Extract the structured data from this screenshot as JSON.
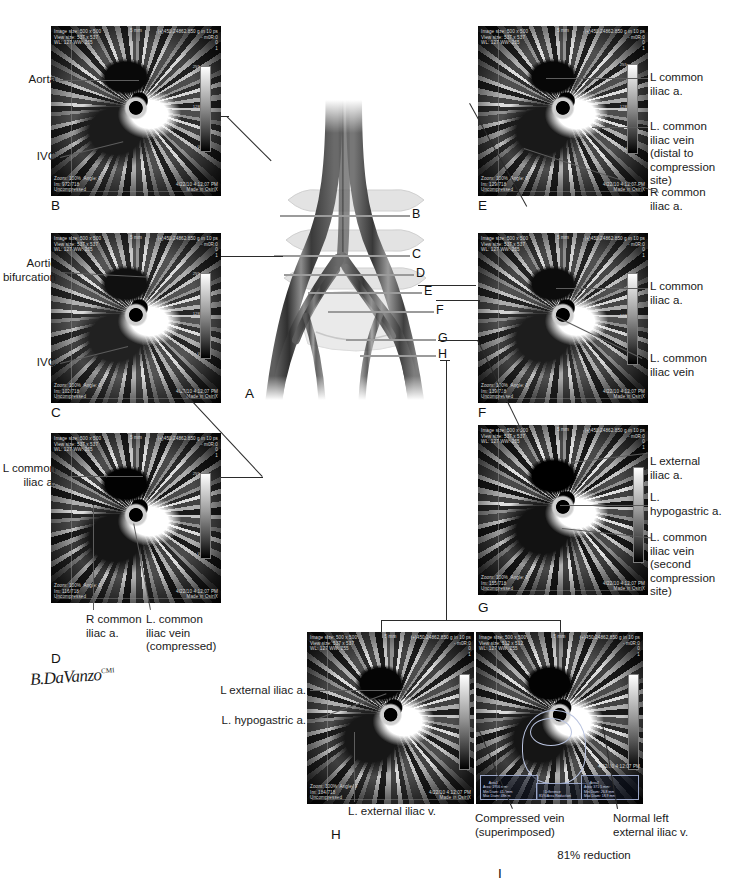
{
  "figure": {
    "artist_signature": "B.DaVanzo",
    "artist_credential": "CMI"
  },
  "scan_overlay": {
    "image_size": "Image size: 500 x 500",
    "view_size": "View size: 537 x 537",
    "view_size_panel_i": "View size: 512 x 512",
    "window": "WL: 127 WW: 255",
    "zoom": "Zoom: 100%  Angle: 0",
    "compression": "Uncompressed",
    "timestamp": "4/22/10 4:12:07 PM",
    "made_in": "Made in OsiriX",
    "scale_bar": "5 mm",
    "top_right_1": "(+)450.24862.850 g in 10 ps",
    "top_right_2": "- m0R:0",
    "top_right_3": "0",
    "top_right_4": "1",
    "colorbar_ticks": [
      "255",
      "128",
      "0"
    ],
    "frames": {
      "b": "Im: 972/718",
      "c": "Im: 102/718",
      "d": "Im: 116/718",
      "e": "Im: 129/718",
      "f": "Im: 139/718",
      "g": "Im: 155/718",
      "h": "Im: 184/718",
      "i": "Im: 184/718"
    }
  },
  "panels": [
    {
      "letter": "A",
      "caption": "Anatomical diagram"
    },
    {
      "letter": "B",
      "caption": "Aorta / IVC level"
    },
    {
      "letter": "C",
      "caption": "Aortic bifurcation level"
    },
    {
      "letter": "D",
      "caption": "Common iliac level"
    },
    {
      "letter": "E",
      "caption": "Left common iliac distal"
    },
    {
      "letter": "F",
      "caption": "Left common iliac"
    },
    {
      "letter": "G",
      "caption": "Second compression site"
    },
    {
      "letter": "H",
      "caption": "Left external iliac"
    },
    {
      "letter": "I",
      "caption": "Area comparison"
    }
  ],
  "diagram": {
    "level_marks": [
      "B",
      "C",
      "D",
      "E",
      "F",
      "G",
      "H"
    ]
  },
  "labels": {
    "panel_b": [
      {
        "text": "Aorta",
        "target": "aorta"
      },
      {
        "text": "IVC",
        "target": "inferior-vena-cava"
      }
    ],
    "panel_c": [
      {
        "text": "Aortic\nbifurcation",
        "target": "aortic-bifurcation"
      },
      {
        "text": "IVC",
        "target": "inferior-vena-cava"
      }
    ],
    "panel_d": [
      {
        "text": "L common\niliac a.",
        "target": "left-common-iliac-artery"
      },
      {
        "text": "R common\niliac a.",
        "target": "right-common-iliac-artery"
      },
      {
        "text": "L. common\niliac vein\n(compressed)",
        "target": "left-common-iliac-vein-compressed"
      }
    ],
    "panel_e": [
      {
        "text": "L common\niliac a.",
        "target": "left-common-iliac-artery"
      },
      {
        "text": "L. common\niliac vein\n(distal to\ncompression\nsite)",
        "target": "left-common-iliac-vein-distal"
      },
      {
        "text": "R common\niliac a.",
        "target": "right-common-iliac-artery"
      }
    ],
    "panel_f": [
      {
        "text": "L common\niliac a.",
        "target": "left-common-iliac-artery"
      },
      {
        "text": "L. common\niliac vein",
        "target": "left-common-iliac-vein"
      }
    ],
    "panel_g": [
      {
        "text": "L external\niliac a.",
        "target": "left-external-iliac-artery"
      },
      {
        "text": "L.\nhypogastric a.",
        "target": "left-hypogastric-artery"
      },
      {
        "text": "L. common\niliac vein\n(second\ncompression\nsite)",
        "target": "left-common-iliac-vein-second-site"
      }
    ],
    "panel_h": [
      {
        "text": "L external iliac a.",
        "target": "left-external-iliac-artery"
      },
      {
        "text": "L. hypogastric a.",
        "target": "left-hypogastric-artery"
      },
      {
        "text": "L. external iliac v.",
        "target": "left-external-iliac-vein"
      }
    ],
    "panel_i": [
      {
        "text": "Compressed vein\n(superimposed)",
        "target": "compressed-vein-superimposed"
      },
      {
        "text": "Normal left\nexternal iliac v.",
        "target": "normal-left-external-iliac-vein"
      },
      {
        "text": "81% reduction",
        "target": "reduction-percentage"
      }
    ]
  },
  "measurements": {
    "area_left_title": "Area1",
    "area_left_lines": [
      "Area: 1956 mm²",
      "Min Diam: 41.3mm",
      "Max Diam: 48mm"
    ],
    "area_middle_title": "Difference",
    "area_middle_lines": [
      "81% Area Reduction"
    ],
    "area_right_title": "Area2",
    "area_right_lines": [
      "Area: 371.5 mm²",
      "Min Diam: 26.8 mm",
      "Max Diam: 18.9 mm"
    ]
  },
  "colors": {
    "ink": "#1a1a1a",
    "leader": "#5d5d5d",
    "scan_background": "#000000",
    "overlay_text": "#d9d9d9"
  }
}
